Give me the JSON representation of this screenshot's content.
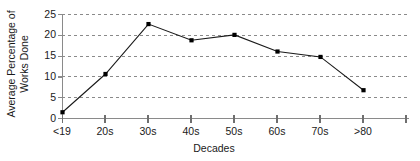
{
  "chart_data": {
    "type": "line",
    "title": "",
    "xlabel": "Decades",
    "ylabel": "Average Percentage of Works Done",
    "ylabel_line1": "Average Percentage of",
    "ylabel_line2": "Works Done",
    "categories": [
      "<19",
      "20s",
      "30s",
      "40s",
      "50s",
      "60s",
      "70s",
      ">80"
    ],
    "values": [
      1.5,
      10.7,
      22.7,
      18.8,
      20.1,
      16.1,
      14.8,
      6.8
    ],
    "series": [
      {
        "name": "Average Percentage of Works Done",
        "values": [
          1.5,
          10.7,
          22.7,
          18.8,
          20.1,
          16.1,
          14.8,
          6.8
        ]
      }
    ],
    "ylim": [
      0,
      25
    ],
    "yticks": [
      0,
      5,
      10,
      15,
      20,
      25
    ],
    "ytick_labels": [
      "0",
      "5",
      "10",
      "15",
      "20",
      "25"
    ],
    "grid": true,
    "grid_style": "dashed-horizontal",
    "legend": "none",
    "marker": "filled-square",
    "line_color": "#1a1a1a",
    "marker_color": "#000000",
    "grid_color": "#808080",
    "axis_color": "#808080"
  },
  "axes": {
    "y_title_line1": "Average Percentage of",
    "y_title_line2": "Works Done",
    "x_title": "Decades"
  }
}
